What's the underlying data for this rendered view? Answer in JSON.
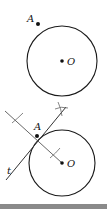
{
  "figures": [
    {
      "name": "circle-with-point",
      "labels": {
        "point": "A",
        "center": "O"
      }
    },
    {
      "name": "tangent-construction",
      "labels": {
        "point": "A",
        "center": "O",
        "tangent": "t"
      }
    }
  ],
  "colors": {
    "stroke": "#1a1a1a",
    "construction": "#555555",
    "bar": "#8a8a8a"
  }
}
